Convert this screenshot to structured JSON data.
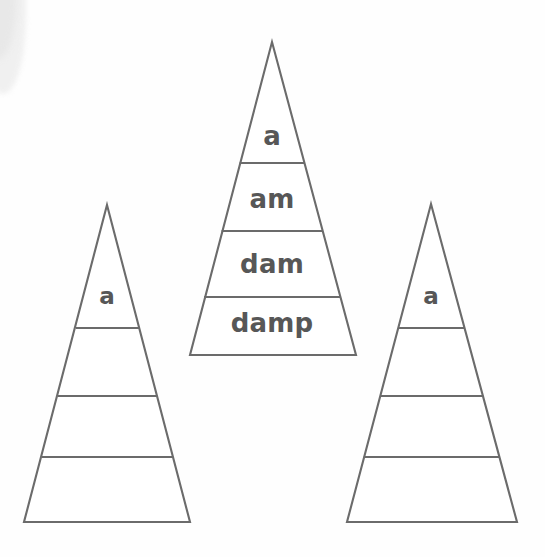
{
  "worksheet": {
    "title": "Word Pyramids",
    "background_color": "#fefefe",
    "line_color": "#6b6b6b",
    "text_color": "#575757"
  },
  "pyramids": [
    {
      "id": "left",
      "name": "pyramid-left",
      "apex": {
        "x": 107,
        "y": 205
      },
      "base": {
        "left_x": 24,
        "right_x": 190,
        "y": 522
      },
      "dividers_y": [
        328,
        396,
        457
      ],
      "rows": [
        {
          "index": 0,
          "label": "a",
          "filled": true
        },
        {
          "index": 1,
          "label": "",
          "filled": false
        },
        {
          "index": 2,
          "label": "",
          "filled": false
        },
        {
          "index": 3,
          "label": "",
          "filled": false
        }
      ]
    },
    {
      "id": "center",
      "name": "pyramid-center",
      "apex": {
        "x": 272,
        "y": 42
      },
      "base": {
        "left_x": 190,
        "right_x": 356,
        "y": 355
      },
      "dividers_y": [
        163,
        231,
        297
      ],
      "rows": [
        {
          "index": 0,
          "label": "a",
          "filled": true
        },
        {
          "index": 1,
          "label": "am",
          "filled": true
        },
        {
          "index": 2,
          "label": "dam",
          "filled": true
        },
        {
          "index": 3,
          "label": "damp",
          "filled": true
        }
      ]
    },
    {
      "id": "right",
      "name": "pyramid-right",
      "apex": {
        "x": 431,
        "y": 204
      },
      "base": {
        "left_x": 347,
        "right_x": 517,
        "y": 522
      },
      "dividers_y": [
        328,
        396,
        457
      ],
      "rows": [
        {
          "index": 0,
          "label": "a",
          "filled": true
        },
        {
          "index": 1,
          "label": "",
          "filled": false
        },
        {
          "index": 2,
          "label": "",
          "filled": false
        },
        {
          "index": 3,
          "label": "",
          "filled": false
        }
      ]
    }
  ],
  "labels": {
    "left_row_0": "a",
    "center_row_0": "a",
    "center_row_1": "am",
    "center_row_2": "dam",
    "center_row_3": "damp",
    "right_row_0": "a"
  }
}
